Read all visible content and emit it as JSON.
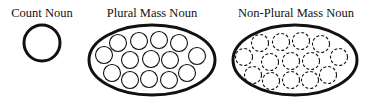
{
  "labels": {
    "count": "Count Noun",
    "plural": "Plural Mass Noun",
    "nonplural": "Non-Plural Mass Noun"
  },
  "colors": {
    "stroke": "#111111",
    "background": "#ffffff"
  },
  "diagram": {
    "count_noun": {
      "shape": "circle",
      "cx": 42,
      "cy": 43,
      "r": 18,
      "style": "solid"
    },
    "plural_mass_noun": {
      "container": {
        "cx": 152,
        "cy": 60,
        "rx": 63,
        "ry": 35
      },
      "member_style": "solid",
      "member_radius": 8.5,
      "members": [
        [
          118,
          43
        ],
        [
          139,
          41
        ],
        [
          159,
          40
        ],
        [
          179,
          43
        ],
        [
          104,
          55
        ],
        [
          130,
          60
        ],
        [
          151,
          59
        ],
        [
          170,
          60
        ],
        [
          197,
          56
        ],
        [
          112,
          73
        ],
        [
          130,
          80
        ],
        [
          149,
          79
        ],
        [
          169,
          80
        ],
        [
          187,
          73
        ]
      ]
    },
    "non_plural_mass_noun": {
      "container": {
        "cx": 295,
        "cy": 60,
        "rx": 62,
        "ry": 35
      },
      "member_style": "dashed",
      "member_radius": 8.5,
      "members": [
        [
          260,
          43
        ],
        [
          281,
          42
        ],
        [
          301,
          41
        ],
        [
          321,
          44
        ],
        [
          244,
          57
        ],
        [
          270,
          62
        ],
        [
          291,
          61
        ],
        [
          311,
          61
        ],
        [
          339,
          57
        ],
        [
          253,
          75
        ],
        [
          271,
          81
        ],
        [
          291,
          80
        ],
        [
          310,
          80
        ],
        [
          328,
          75
        ]
      ]
    }
  }
}
